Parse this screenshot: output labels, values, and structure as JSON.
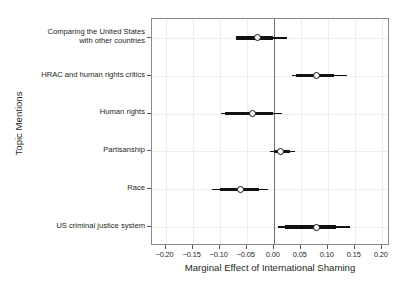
{
  "chart_data": {
    "type": "scatter",
    "title": "",
    "xlabel": "Marginal Effect of International Shaming",
    "ylabel": "Topic Mentions",
    "xlim": [
      -0.225,
      0.215
    ],
    "ylim": [
      0,
      6
    ],
    "grid": true,
    "legend": null,
    "xticks": [
      -0.2,
      -0.15,
      -0.1,
      -0.05,
      0.0,
      0.05,
      0.1,
      0.15,
      0.2
    ],
    "xticklabels": [
      "−0.20",
      "−0.15",
      "−0.10",
      "−0.05",
      "0.00",
      "0.05",
      "0.10",
      "0.15",
      "0.20"
    ],
    "reference_line": 0.0,
    "categories": [
      "Comparing the United States with other countries",
      "HRAC and human rights critics",
      "Human rights",
      "Partisanship",
      "Race",
      "US criminal justice system"
    ],
    "points": [
      {
        "category": "Comparing the United States with other countries",
        "label_lines": [
          "Comparing the United States",
          "with other countries"
        ],
        "estimate": -0.03,
        "ci_inner_low": -0.069,
        "ci_inner_high": -0.002,
        "ci_outer_low": -0.069,
        "ci_outer_high": 0.024
      },
      {
        "category": "HRAC and human rights critics",
        "label_lines": [
          "HRAC and human rights critics"
        ],
        "estimate": 0.08,
        "ci_inner_low": 0.041,
        "ci_inner_high": 0.112,
        "ci_outer_low": 0.033,
        "ci_outer_high": 0.135
      },
      {
        "category": "Human rights",
        "label_lines": [
          "Human rights"
        ],
        "estimate": -0.04,
        "ci_inner_low": -0.09,
        "ci_inner_high": -0.002,
        "ci_outer_low": -0.098,
        "ci_outer_high": 0.015
      },
      {
        "category": "Partisanship",
        "label_lines": [
          "Partisanship"
        ],
        "estimate": 0.013,
        "ci_inner_low": 0.0,
        "ci_inner_high": 0.03,
        "ci_outer_low": -0.007,
        "ci_outer_high": 0.04
      },
      {
        "category": "Race",
        "label_lines": [
          "Race"
        ],
        "estimate": -0.062,
        "ci_inner_low": -0.1,
        "ci_inner_high": -0.028,
        "ci_outer_low": -0.115,
        "ci_outer_high": -0.01
      },
      {
        "category": "US criminal justice system",
        "label_lines": [
          "US criminal justice system"
        ],
        "estimate": 0.079,
        "ci_inner_low": 0.02,
        "ci_inner_high": 0.115,
        "ci_outer_low": 0.008,
        "ci_outer_high": 0.142
      }
    ],
    "colors": {
      "point_edge": "#111111",
      "point_fill": "#ffffff",
      "interval": "#111111",
      "grid": "#ededed",
      "frame": "#8a8a8a",
      "zero_line": "#6e6e6e",
      "text": "#231f20",
      "background": "#ffffff"
    }
  }
}
